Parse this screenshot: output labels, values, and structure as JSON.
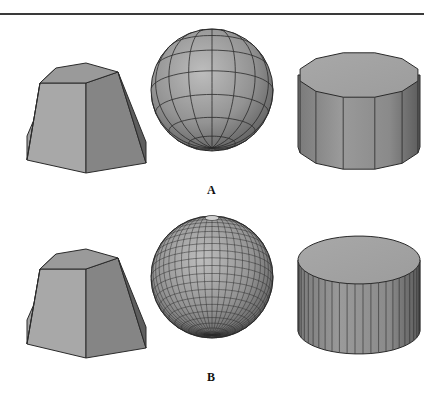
{
  "figure": {
    "rows": [
      {
        "label": "A",
        "description": "Low tessellation",
        "shapes": [
          {
            "name": "hexagonal-frustum",
            "sides": 6
          },
          {
            "name": "faceted-sphere",
            "meridians": 16,
            "parallels": 8
          },
          {
            "name": "faceted-cylinder",
            "sides": 12
          }
        ]
      },
      {
        "label": "B",
        "description": "High tessellation",
        "shapes": [
          {
            "name": "hexagonal-frustum",
            "sides": 6
          },
          {
            "name": "faceted-sphere",
            "meridians": 48,
            "parallels": 24
          },
          {
            "name": "faceted-cylinder",
            "sides": 48
          }
        ]
      }
    ],
    "colors": {
      "background": "#ffffff",
      "edge": "#2a2a2a",
      "face_light": "#b5b5b5",
      "face_mid": "#8f8f8f",
      "face_dark": "#6a6a6a",
      "rule": "#3a3a3a"
    }
  }
}
